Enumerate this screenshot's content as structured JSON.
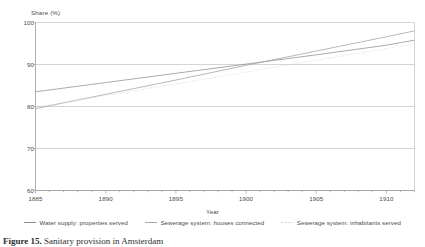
{
  "chart_data": {
    "type": "line",
    "title": "",
    "xlabel": "Year",
    "ylabel": "Share (%)",
    "y_axis_title": "Share (%)",
    "xlim": [
      1885,
      1912
    ],
    "ylim": [
      60,
      100
    ],
    "y_ticks": [
      100,
      90,
      80,
      70,
      60
    ],
    "x_ticks": [
      1885,
      1890,
      1895,
      1900,
      1905,
      1910
    ],
    "x_minor_tick_step": 1,
    "grid": "horizontal",
    "legend_position": "bottom",
    "series": [
      {
        "name": "Water supply: properties served",
        "style": "solid",
        "color": "#8d8d8d",
        "x": [
          1885,
          1890,
          1895,
          1900,
          1905,
          1910,
          1912
        ],
        "values": [
          83.5,
          85.7,
          87.9,
          90.1,
          92.3,
          94.6,
          95.8
        ]
      },
      {
        "name": "Sewerage system: houses connected",
        "style": "solid",
        "color": "#a0a0a0",
        "x": [
          1885,
          1890,
          1895,
          1900,
          1905,
          1910,
          1912
        ],
        "values": [
          79.5,
          82.9,
          86.3,
          89.8,
          93.2,
          96.6,
          98.0
        ]
      },
      {
        "name": "Sewerage system: inhabitants served",
        "style": "dotted",
        "color": "#d2d2d2",
        "x": [
          1885,
          1890,
          1895,
          1900,
          1905,
          1910,
          1912
        ],
        "values": [
          79.8,
          82.6,
          85.4,
          88.2,
          91.0,
          93.8,
          95.0
        ]
      }
    ]
  },
  "legend": {
    "items": [
      {
        "label": "Water supply: properties served",
        "swatch": "line-solid-dark-icon"
      },
      {
        "label": "Sewerage system: houses connected",
        "swatch": "line-solid-mid-icon"
      },
      {
        "label": "Sewerage system: inhabitants served",
        "swatch": "line-dotted-icon"
      }
    ]
  },
  "axes": {
    "y_title": "Share (%)",
    "x_title": "Year",
    "y_tick_labels": [
      "100",
      "90",
      "80",
      "70",
      "60"
    ],
    "x_tick_labels": [
      "1885",
      "1890",
      "1895",
      "1900",
      "1905",
      "1910"
    ]
  },
  "caption": {
    "number": "Figure 15.",
    "text": "Sanitary provision in Amsterdam"
  }
}
